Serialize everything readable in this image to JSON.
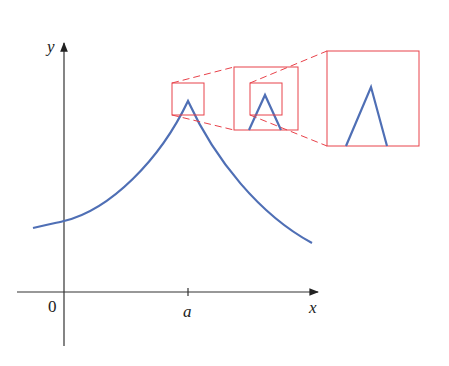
{
  "diagram": {
    "axes": {
      "x_label": "x",
      "y_label": "y",
      "origin_label": "0",
      "tick_label": "a"
    },
    "colors": {
      "curve": "#4f6fb5",
      "zoom_box": "#e8424a",
      "axis": "#333333",
      "background": "#ffffff"
    },
    "zoom_levels": [
      {
        "name": "small-box",
        "level": 1
      },
      {
        "name": "middle-box",
        "level": 2
      },
      {
        "name": "large-box",
        "level": 3
      }
    ]
  }
}
